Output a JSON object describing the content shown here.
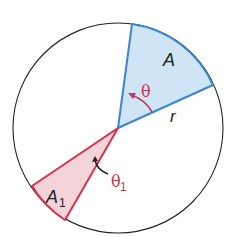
{
  "diagram": {
    "circle": {
      "cx": 118,
      "cy": 128,
      "r": 105,
      "stroke": "#222222"
    },
    "sector_A": {
      "label": "A",
      "angle_label": "θ",
      "radius_label": "r",
      "fill": "#cfe4f5",
      "stroke": "#3a86d0"
    },
    "sector_A1": {
      "label": "A",
      "label_subscript": "1",
      "angle_label": "θ",
      "angle_subscript": "1",
      "fill": "#f2d3d8",
      "stroke": "#d9304f"
    },
    "arrow_color": "#c23a5a"
  }
}
